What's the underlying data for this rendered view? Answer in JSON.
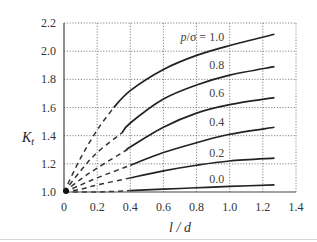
{
  "chart_data": {
    "type": "line",
    "title": "",
    "xlabel": "l / d",
    "ylabel": "K_t",
    "xlim": [
      0,
      1.4
    ],
    "ylim": [
      1.0,
      2.2
    ],
    "x_ticks": [
      "0",
      "0.2",
      "0.4",
      "0.6",
      "0.8",
      "1.0",
      "1.2",
      "1.4"
    ],
    "y_ticks": [
      "1.0",
      "1.2",
      "1.4",
      "1.6",
      "1.8",
      "2.0",
      "2.2"
    ],
    "grid": true,
    "legend_title": "p/σ",
    "series": [
      {
        "name": "1.0",
        "label": "p/σ = 1.0",
        "solid_from": 0.3,
        "x": [
          0,
          0.1,
          0.2,
          0.3,
          0.4,
          0.6,
          0.8,
          1.0,
          1.27
        ],
        "y": [
          1.0,
          1.24,
          1.44,
          1.6,
          1.72,
          1.87,
          1.97,
          2.04,
          2.12
        ]
      },
      {
        "name": "0.8",
        "label": "0.8",
        "solid_from": 0.35,
        "x": [
          0,
          0.1,
          0.2,
          0.35,
          0.4,
          0.6,
          0.8,
          1.0,
          1.27
        ],
        "y": [
          1.0,
          1.15,
          1.28,
          1.42,
          1.49,
          1.66,
          1.76,
          1.83,
          1.89
        ]
      },
      {
        "name": "0.6",
        "label": "0.6",
        "solid_from": 0.38,
        "x": [
          0,
          0.1,
          0.2,
          0.38,
          0.4,
          0.6,
          0.8,
          1.0,
          1.27
        ],
        "y": [
          1.0,
          1.09,
          1.17,
          1.3,
          1.32,
          1.46,
          1.56,
          1.62,
          1.67
        ]
      },
      {
        "name": "0.4",
        "label": "0.4",
        "solid_from": 0.4,
        "x": [
          0,
          0.1,
          0.2,
          0.4,
          0.6,
          0.8,
          1.0,
          1.27
        ],
        "y": [
          1.0,
          1.05,
          1.1,
          1.19,
          1.28,
          1.35,
          1.41,
          1.46
        ]
      },
      {
        "name": "0.2",
        "label": "0.2",
        "solid_from": 0.4,
        "x": [
          0,
          0.1,
          0.2,
          0.4,
          0.6,
          0.8,
          1.0,
          1.27
        ],
        "y": [
          1.0,
          1.02,
          1.05,
          1.1,
          1.15,
          1.19,
          1.22,
          1.24
        ]
      },
      {
        "name": "0.0",
        "label": "0.0",
        "solid_from": 0.4,
        "x": [
          0,
          0.2,
          0.4,
          0.6,
          0.8,
          1.0,
          1.27
        ],
        "y": [
          1.0,
          1.0,
          1.01,
          1.02,
          1.03,
          1.04,
          1.05
        ]
      }
    ],
    "annotations": [
      {
        "text": "p/σ = 1.0",
        "x": 0.9,
        "y": 2.1
      },
      {
        "text": "0.8",
        "x": 0.9,
        "y": 1.9
      },
      {
        "text": "0.6",
        "x": 0.9,
        "y": 1.7
      },
      {
        "text": "0.4",
        "x": 0.9,
        "y": 1.5
      },
      {
        "text": "0.2",
        "x": 0.9,
        "y": 1.28
      },
      {
        "text": "0.0",
        "x": 0.9,
        "y": 1.09
      }
    ]
  }
}
